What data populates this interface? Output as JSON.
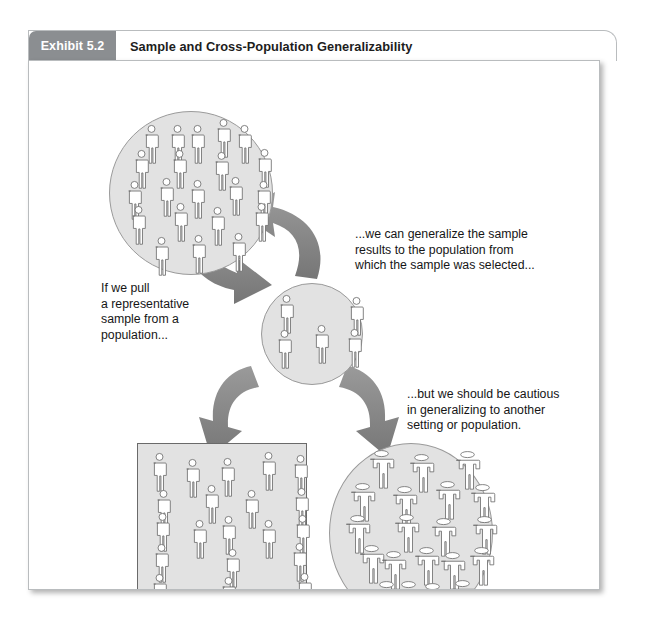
{
  "exhibit": {
    "tab_number": "Exhibit 5.2",
    "title": "Sample and Cross-Population Generalizability"
  },
  "callouts": {
    "left": "If we pull\na representative\nsample from a\npopulation...",
    "top_right": "...we can generalize the sample\nresults to the population from\nwhich the sample was selected...",
    "bottom_right": "...but we should be cautious\nin generalizing to another\nsetting or population."
  },
  "figure": {
    "groups": [
      {
        "name": "population-circle",
        "shape": "circle",
        "label": "population",
        "person_count": 21,
        "person_style": "round-head"
      },
      {
        "name": "sample-circle",
        "shape": "circle",
        "label": "sample",
        "person_count": 5,
        "person_style": "round-head"
      },
      {
        "name": "same-population-square",
        "shape": "square",
        "label": "population from which sample was selected",
        "person_count": 20,
        "person_style": "round-head"
      },
      {
        "name": "other-population-circle",
        "shape": "circle",
        "label": "another setting or population",
        "person_count": 20,
        "person_style": "oval-head"
      }
    ],
    "arrows": [
      {
        "name": "arrow-population-to-sample",
        "direction": "down-right",
        "meaning": "sampling"
      },
      {
        "name": "arrow-sample-to-population",
        "direction": "up-left",
        "meaning": "generalize back"
      },
      {
        "name": "arrow-sample-to-same-population",
        "direction": "down-left",
        "meaning": "generalize to same population"
      },
      {
        "name": "arrow-sample-to-other-population",
        "direction": "down-right",
        "meaning": "generalize to other population"
      }
    ]
  },
  "colors": {
    "tab_gray": "#8b8e91",
    "group_fill": "#e2e2e2",
    "group_stroke": "#9a9a9a",
    "arrow_fill": "#808080",
    "person_fill": "#ffffff",
    "person_stroke": "#6e6e6e",
    "text": "#161616",
    "panel_border": "#b9bcbe"
  }
}
